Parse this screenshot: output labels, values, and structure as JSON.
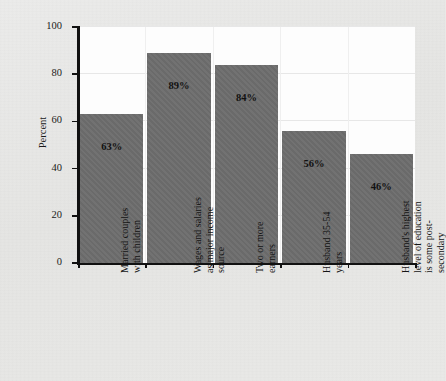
{
  "figure": {
    "title_fragment": "",
    "background_color": "#e9e9e7",
    "plot_background_color": "#fdfdfd",
    "bar_color": "#6d6d6d",
    "axis_color": "#111111"
  },
  "chart_data": {
    "type": "bar",
    "title": "",
    "xlabel": "",
    "ylabel": "Percent",
    "ylim": [
      0,
      100
    ],
    "yticks": [
      0,
      20,
      40,
      60,
      80,
      100
    ],
    "ytick_labels": [
      "0",
      "20",
      "40",
      "60",
      "80",
      "100"
    ],
    "grid": true,
    "legend": null,
    "categories": [
      "Married couples\nwith children",
      "Wages and salaries\nas major income\nsource",
      "Two or more\nearners",
      "Husband 35-54\nyears",
      "Husband's highest\nlevel of education\nis some post-\nsecondary"
    ],
    "values": [
      63,
      89,
      84,
      56,
      46
    ],
    "data_labels": [
      "63%",
      "89%",
      "84%",
      "56%",
      "46%"
    ]
  }
}
